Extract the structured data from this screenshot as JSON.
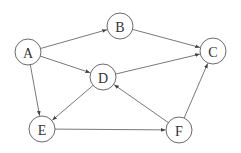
{
  "diagram": {
    "type": "directed-graph",
    "node_radius": 13,
    "colors": {
      "stroke": "#5a5a5a",
      "edge": "#555555",
      "label": "#333333",
      "background": "#ffffff"
    },
    "nodes": [
      {
        "id": "A",
        "label": "A",
        "x": 28,
        "y": 52
      },
      {
        "id": "B",
        "label": "B",
        "x": 120,
        "y": 26
      },
      {
        "id": "C",
        "label": "C",
        "x": 213,
        "y": 51
      },
      {
        "id": "D",
        "label": "D",
        "x": 103,
        "y": 77
      },
      {
        "id": "E",
        "label": "E",
        "x": 42,
        "y": 129
      },
      {
        "id": "F",
        "label": "F",
        "x": 179,
        "y": 130
      }
    ],
    "edges": [
      {
        "from": "A",
        "to": "B"
      },
      {
        "from": "A",
        "to": "D"
      },
      {
        "from": "A",
        "to": "E"
      },
      {
        "from": "B",
        "to": "C"
      },
      {
        "from": "D",
        "to": "C"
      },
      {
        "from": "D",
        "to": "E"
      },
      {
        "from": "E",
        "to": "F"
      },
      {
        "from": "F",
        "to": "D"
      },
      {
        "from": "F",
        "to": "C"
      }
    ]
  }
}
